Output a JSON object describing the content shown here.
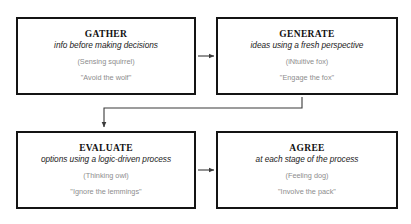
{
  "diagram": {
    "nodes": [
      {
        "id": "gather",
        "title": "GATHER",
        "subtitle": "info before making decisions",
        "type_label": "(Sensing squirrel)",
        "motto": "\"Avoid the wolf\""
      },
      {
        "id": "generate",
        "title": "GENERATE",
        "subtitle": "ideas using a fresh perspective",
        "type_label": "(iNtuitive fox)",
        "motto": "\"Engage the fox\""
      },
      {
        "id": "evaluate",
        "title": "EVALUATE",
        "subtitle": "options using a logic-driven process",
        "type_label": "(Thinking owl)",
        "motto": "\"Ignore the lemmings\""
      },
      {
        "id": "agree",
        "title": "AGREE",
        "subtitle": "at each stage of the process",
        "type_label": "(Feeling dog)",
        "motto": "\"Involve the pack\""
      }
    ],
    "connectors": [
      {
        "id": "gather-to-generate",
        "from": "gather",
        "to": "generate",
        "shape": "straight-right"
      },
      {
        "id": "generate-to-evaluate",
        "from": "generate",
        "to": "evaluate",
        "shape": "elbow-down-left"
      },
      {
        "id": "evaluate-to-agree",
        "from": "evaluate",
        "to": "agree",
        "shape": "straight-right"
      }
    ],
    "colors": {
      "border": "#141414",
      "title": "#111111",
      "subtitle": "#1b1b1b",
      "muted": "#8d8d8d",
      "connector": "#3a3a3a",
      "background": "#ffffff"
    }
  }
}
